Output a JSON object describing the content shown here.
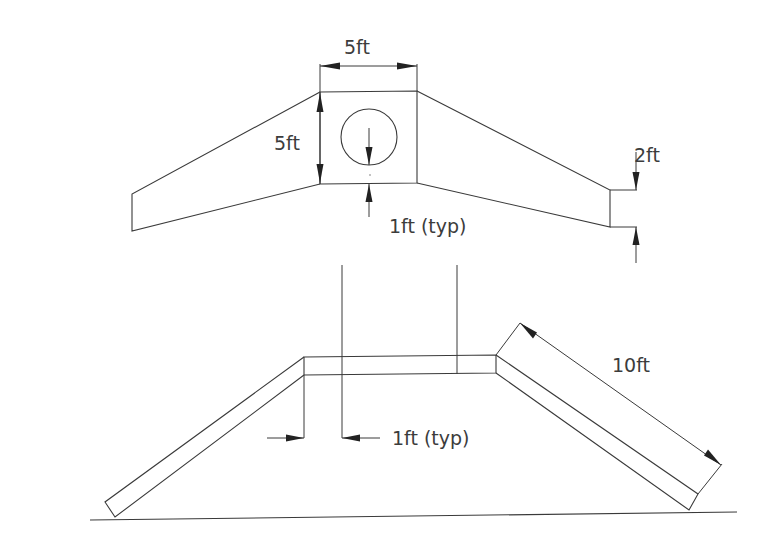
{
  "diagram": {
    "type": "engineering-drawing",
    "plan_view": {
      "box_width_label": "5ft",
      "box_height_label": "5ft",
      "wall_thickness_label": "1ft (typ)",
      "wing_end_label": "2ft"
    },
    "elevation_view": {
      "leg_length_label": "10ft",
      "wall_thickness_label": "1ft (typ)"
    },
    "colors": {
      "line": "#3a3a3a",
      "text": "#3c3c3c",
      "background": "#ffffff"
    }
  }
}
